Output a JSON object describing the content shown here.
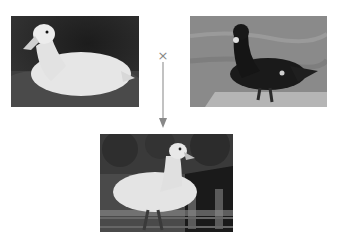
{
  "diagram": {
    "type": "crossbreeding",
    "parents": [
      {
        "label": "white duck",
        "description": "White duck sitting on grass"
      },
      {
        "label": "black muscovy duck",
        "description": "Black Muscovy duck standing on stone by water"
      }
    ],
    "operator": "×",
    "offspring": {
      "label": "white muscovy hybrid",
      "description": "White duck with red facial caruncles standing in front of a wooden structure"
    },
    "colors": {
      "arrow": "#999999",
      "cross": "#888888",
      "background": "#ffffff"
    }
  }
}
